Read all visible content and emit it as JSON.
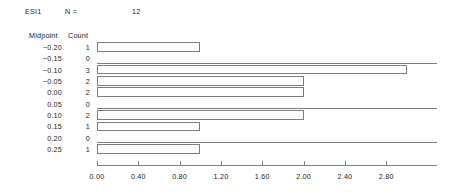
{
  "header": {
    "variable": "ESI1",
    "n_label": "N =",
    "n_value": "12"
  },
  "columns": {
    "midpoint": "Midpoint",
    "count": "Count"
  },
  "chart_data": {
    "type": "bar",
    "orientation": "horizontal",
    "title": "ESI1",
    "xlabel": "",
    "ylabel": "Midpoint",
    "grid": false,
    "legend": null,
    "xlim": [
      0.0,
      3.05
    ],
    "xticks": [
      "0.00",
      "0.40",
      "0.80",
      "1.20",
      "1.60",
      "2.00",
      "2.40",
      "2.80"
    ],
    "xtick_values": [
      0.0,
      0.4,
      0.8,
      1.2,
      1.6,
      2.0,
      2.4,
      2.8
    ],
    "categories": [
      "-0.20",
      "-0.15",
      "-0.10",
      "-0.05",
      "0.00",
      "0.05",
      "0.10",
      "0.15",
      "0.20",
      "0.25"
    ],
    "values": [
      1,
      0,
      3,
      2,
      2,
      0,
      2,
      1,
      0,
      1
    ],
    "bar_fill": "#ffffff",
    "bar_stroke": "#7d7d7d",
    "rows": [
      {
        "midpoint": "-0.20",
        "count": "1",
        "value": 1
      },
      {
        "midpoint": "-0.15",
        "count": "0",
        "value": 0
      },
      {
        "midpoint": "-0.10",
        "count": "3",
        "value": 3
      },
      {
        "midpoint": "-0.05",
        "count": "2",
        "value": 2
      },
      {
        "midpoint": "0.00",
        "count": "2",
        "value": 2
      },
      {
        "midpoint": "0.05",
        "count": "0",
        "value": 0
      },
      {
        "midpoint": "0.10",
        "count": "2",
        "value": 2
      },
      {
        "midpoint": "0.15",
        "count": "1",
        "value": 1
      },
      {
        "midpoint": "0.20",
        "count": "0",
        "value": 0
      },
      {
        "midpoint": "0.25",
        "count": "1",
        "value": 1
      }
    ]
  },
  "geometry": {
    "origin_x": 97,
    "unit_px": 103.3,
    "row_height": 11.35,
    "first_row_top": 41.5,
    "axis_top": 165,
    "axis_width": 340
  }
}
